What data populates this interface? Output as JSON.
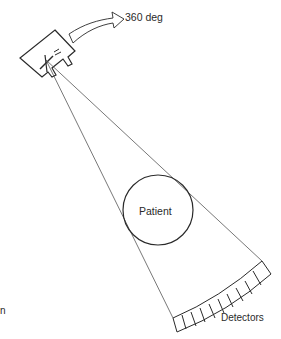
{
  "diagram": {
    "labels": {
      "rotation": "360 deg",
      "patient": "Patient",
      "detectors": "Detectors",
      "cropped_fragment": "n"
    },
    "components": {
      "xray_source": {
        "kind": "x-ray tube housing",
        "beam_origin": [
          46,
          60
        ]
      },
      "rotation_arrow": {
        "direction": "clockwise",
        "degrees": 360
      },
      "fan_beam": {
        "left_edge_end": [
          173,
          318
        ],
        "right_edge_end": [
          262,
          261
        ]
      },
      "patient": {
        "shape": "circle",
        "center": [
          158,
          210
        ],
        "radius": 35
      },
      "detector_array": {
        "cell_count": 10,
        "shape": "arc"
      }
    },
    "colors": {
      "stroke": "#2a2a2a",
      "background": "#ffffff"
    }
  }
}
